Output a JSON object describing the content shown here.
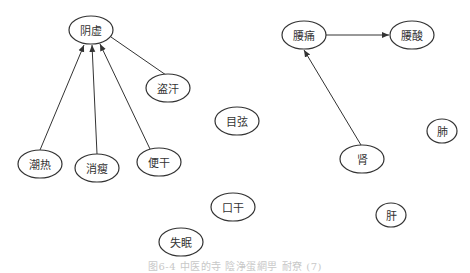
{
  "diagram": {
    "type": "directed-graph",
    "nodes": [
      {
        "id": "yinxu",
        "label": "阴虚",
        "x": 91,
        "y": 30,
        "rx": 22,
        "ry": 14
      },
      {
        "id": "daohan",
        "label": "盗汗",
        "x": 168,
        "y": 88,
        "rx": 22,
        "ry": 14
      },
      {
        "id": "chaore",
        "label": "潮热",
        "x": 40,
        "y": 164,
        "rx": 22,
        "ry": 14
      },
      {
        "id": "xiaoshou",
        "label": "消瘦",
        "x": 97,
        "y": 168,
        "rx": 22,
        "ry": 14
      },
      {
        "id": "biangan",
        "label": "便干",
        "x": 159,
        "y": 162,
        "rx": 22,
        "ry": 14
      },
      {
        "id": "muxuan",
        "label": "目弦",
        "x": 237,
        "y": 121,
        "rx": 22,
        "ry": 14
      },
      {
        "id": "yaotong",
        "label": "腰痛",
        "x": 304,
        "y": 35,
        "rx": 22,
        "ry": 14
      },
      {
        "id": "yaosuan",
        "label": "腰酸",
        "x": 412,
        "y": 35,
        "rx": 22,
        "ry": 14
      },
      {
        "id": "shen",
        "label": "肾",
        "x": 362,
        "y": 159,
        "rx": 22,
        "ry": 14
      },
      {
        "id": "fei",
        "label": "肺",
        "x": 442,
        "y": 131,
        "rx": 15,
        "ry": 12
      },
      {
        "id": "kougan",
        "label": "口干",
        "x": 233,
        "y": 207,
        "rx": 22,
        "ry": 14
      },
      {
        "id": "shimian",
        "label": "失眠",
        "x": 181,
        "y": 242,
        "rx": 22,
        "ry": 14
      },
      {
        "id": "gan",
        "label": "肝",
        "x": 391,
        "y": 215,
        "rx": 15,
        "ry": 12
      }
    ],
    "edges": [
      {
        "from": "chaore",
        "to": "yinxu",
        "x1": 40,
        "y1": 150,
        "x2": 84,
        "y2": 45,
        "arrow": true
      },
      {
        "from": "xiaoshou",
        "to": "yinxu",
        "x1": 97,
        "y1": 154,
        "x2": 92,
        "y2": 45,
        "arrow": true
      },
      {
        "from": "biangan",
        "to": "yinxu",
        "x1": 150,
        "y1": 149,
        "x2": 100,
        "y2": 44,
        "arrow": true
      },
      {
        "from": "daohan",
        "to": "yinxu",
        "x1": 166,
        "y1": 75,
        "x2": 111,
        "y2": 37,
        "arrow": false
      },
      {
        "from": "yaotong",
        "to": "yaosuan",
        "x1": 326,
        "y1": 35,
        "x2": 389,
        "y2": 35,
        "arrow": true
      },
      {
        "from": "shen",
        "to": "yaotong",
        "x1": 361,
        "y1": 145,
        "x2": 304,
        "y2": 50,
        "arrow": true
      }
    ],
    "colors": {
      "stroke": "#333333",
      "text": "#333333",
      "caption": "#c8c8c8"
    }
  },
  "caption": "图6-4 中医的寺 陰浄蛋網甼 耐尞 (7)"
}
